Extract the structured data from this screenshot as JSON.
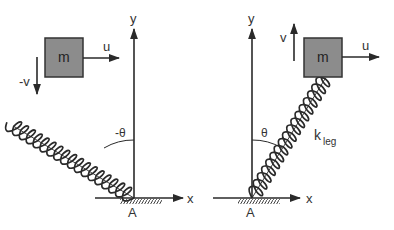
{
  "colors": {
    "ink": "#2a2a2a",
    "mass_fill": "#8c8c8c",
    "mass_stroke": "#333333",
    "background": "#ffffff"
  },
  "left_diagram": {
    "axis_y_label": "y",
    "axis_x_label": "x",
    "origin_label": "A",
    "mass_label": "m",
    "horizontal_velocity_label": "u",
    "vertical_velocity_label": "-v",
    "angle_label": "-θ"
  },
  "right_diagram": {
    "axis_y_label": "y",
    "axis_x_label": "x",
    "origin_label": "A",
    "mass_label": "m",
    "horizontal_velocity_label": "u",
    "vertical_velocity_label": "v",
    "angle_label": "θ",
    "spring_label": "k",
    "spring_label_subscript": "leg"
  }
}
